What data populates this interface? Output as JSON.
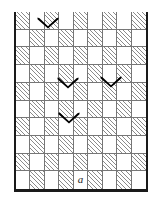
{
  "figure": {
    "label": "a",
    "colors": {
      "wall": "#1a1a1a",
      "grid_line": "#767676",
      "hatch": "#8a8a8a",
      "cell_empty": "#ffffff",
      "mark": "#000000",
      "background": "#ffffff"
    },
    "box": {
      "walls": [
        "left",
        "right",
        "bottom"
      ],
      "open_side": "top",
      "wall_thickness_px": 3
    },
    "grid": {
      "columns": 9,
      "rows": 10,
      "pattern": "checkerboard",
      "hatched_parity": "even",
      "cell_width_px": 14.4,
      "cell_height_px": 17.7
    },
    "cells": [
      [
        1,
        0,
        1,
        0,
        1,
        0,
        1,
        0,
        1
      ],
      [
        0,
        1,
        0,
        1,
        0,
        1,
        0,
        1,
        0
      ],
      [
        1,
        0,
        1,
        0,
        1,
        0,
        1,
        0,
        1
      ],
      [
        0,
        1,
        0,
        1,
        0,
        1,
        0,
        1,
        0
      ],
      [
        1,
        0,
        1,
        0,
        1,
        0,
        1,
        0,
        1
      ],
      [
        0,
        1,
        0,
        1,
        0,
        1,
        0,
        1,
        0
      ],
      [
        1,
        0,
        1,
        0,
        1,
        0,
        1,
        0,
        1
      ],
      [
        0,
        1,
        0,
        1,
        0,
        1,
        0,
        1,
        0
      ],
      [
        1,
        0,
        1,
        0,
        1,
        0,
        1,
        0,
        1
      ],
      [
        0,
        1,
        0,
        1,
        0,
        1,
        0,
        1,
        0
      ]
    ],
    "label_cell": {
      "row": 9,
      "col": 4,
      "text": "a"
    },
    "marks": [
      {
        "id": "v-mark-1",
        "name": "notch-top-left",
        "left_px": 37,
        "top_px": 17
      },
      {
        "id": "v-mark-2",
        "name": "notch-middle-left",
        "left_px": 57,
        "top_px": 77
      },
      {
        "id": "v-mark-3",
        "name": "notch-middle-right",
        "left_px": 100,
        "top_px": 76
      },
      {
        "id": "v-mark-4",
        "name": "notch-lower",
        "left_px": 58,
        "top_px": 112
      }
    ]
  }
}
